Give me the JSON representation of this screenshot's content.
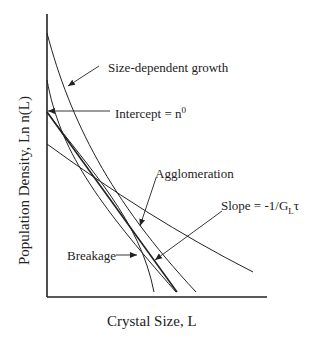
{
  "diagram": {
    "type": "crystal size distribution plot",
    "x_axis_label": "Crystal Size, L",
    "y_axis_label": "Population Density, Ln n(L)",
    "annotations": {
      "size_dependent_growth": "Size-dependent growth",
      "intercept_prefix": "Intercept = n",
      "intercept_sup": "0",
      "agglomeration": "Agglomeration",
      "slope_prefix": "Slope = -1/G",
      "slope_sub": "L",
      "slope_suffix": "τ",
      "breakage": "Breakage"
    },
    "curves": [
      {
        "name": "size-dependent growth",
        "shape": "concave curve"
      },
      {
        "name": "agglomeration",
        "shape": "curve"
      },
      {
        "name": "ideal MSMPR straight line",
        "shape": "line"
      },
      {
        "name": "breakage",
        "shape": "downward bending curve"
      },
      {
        "name": "flatter line",
        "shape": "line"
      }
    ],
    "line_color": "#222222"
  }
}
